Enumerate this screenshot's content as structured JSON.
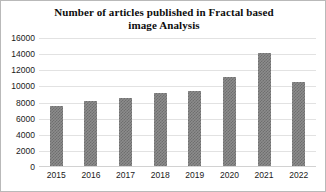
{
  "chart_data": {
    "type": "bar",
    "title": "Number of articles published in Fractal based image Analysis",
    "title_line1": "Number of articles published in Fractal based",
    "title_line2": "image Analysis",
    "xlabel": "",
    "ylabel": "",
    "categories": [
      "2015",
      "2016",
      "2017",
      "2018",
      "2019",
      "2020",
      "2021",
      "2022"
    ],
    "values": [
      7600,
      8200,
      8500,
      9200,
      9400,
      11200,
      14200,
      10500
    ],
    "ylim": [
      0,
      16000
    ],
    "yticks": [
      0,
      2000,
      4000,
      6000,
      8000,
      10000,
      12000,
      14000,
      16000
    ],
    "ytick_labels": [
      "0",
      "2000",
      "4000",
      "6000",
      "8000",
      "10000",
      "12000",
      "14000",
      "16000"
    ],
    "grid": true,
    "grid_axis": "y",
    "legend": false,
    "bar_color": "#8c8c8c",
    "bar_pattern": "checkered-hatch",
    "grid_color": "#e2e2e2",
    "background_color": "#ffffff",
    "border_color": "#b9b9b9",
    "text_color": "#1a1a1a"
  }
}
